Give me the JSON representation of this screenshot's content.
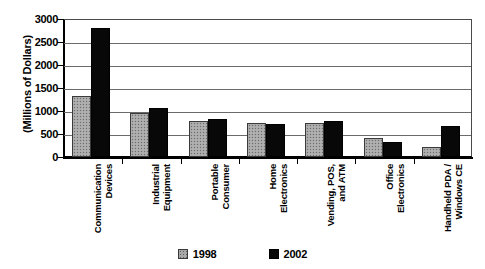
{
  "chart_data": {
    "type": "bar",
    "title": "",
    "subtitle": "",
    "xlabel": "",
    "ylabel": "(Millions of Dollars)",
    "ylim": [
      0,
      3000
    ],
    "yticks": [
      0,
      500,
      1000,
      1500,
      2000,
      2500,
      3000
    ],
    "ytick_labels": [
      "0",
      "500",
      "1000",
      "1500",
      "2000",
      "2500",
      "3000"
    ],
    "grid": true,
    "grid_axis": "y",
    "legend_position": "bottom",
    "orientation": "vertical",
    "grouping": "clustered",
    "xtick_label_rotation": 90,
    "categories": [
      "Communication Devices",
      "Industrial Equipment",
      "Portable Consumer",
      "Home Electronics",
      "Vending, POS, and ATM",
      "Office Electronics",
      "Handheld PDA / Windows CE"
    ],
    "category_lines": [
      [
        "Communication",
        "Devices"
      ],
      [
        "Industrial",
        "Equipment"
      ],
      [
        "Portable",
        "Consumer"
      ],
      [
        "Home",
        "Electronics"
      ],
      [
        "Vending, POS,",
        "and ATM"
      ],
      [
        "Office",
        "Electronics"
      ],
      [
        "Handheld PDA /",
        "Windows CE"
      ]
    ],
    "series": [
      {
        "name": "1998",
        "color": "#a8a8a8",
        "values": [
          1320,
          950,
          780,
          740,
          730,
          420,
          220
        ]
      },
      {
        "name": "2002",
        "color": "#080808",
        "values": [
          2800,
          1060,
          820,
          720,
          780,
          330,
          680
        ]
      }
    ]
  },
  "legend": {
    "items": [
      {
        "label": "1998",
        "swatch": "gray-stippled-swatch"
      },
      {
        "label": "2002",
        "swatch": "black-swatch"
      }
    ]
  }
}
